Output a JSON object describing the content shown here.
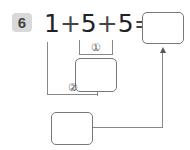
{
  "problem": {
    "number": "6",
    "expression": {
      "a": "1",
      "op1": "+",
      "b": "5",
      "op2": "+",
      "c": "5",
      "eq": "="
    },
    "step_labels": {
      "step1": "①",
      "step2": "②"
    },
    "answer_boxes": {
      "step1_result": "",
      "step2_result": "",
      "final_answer": ""
    }
  }
}
